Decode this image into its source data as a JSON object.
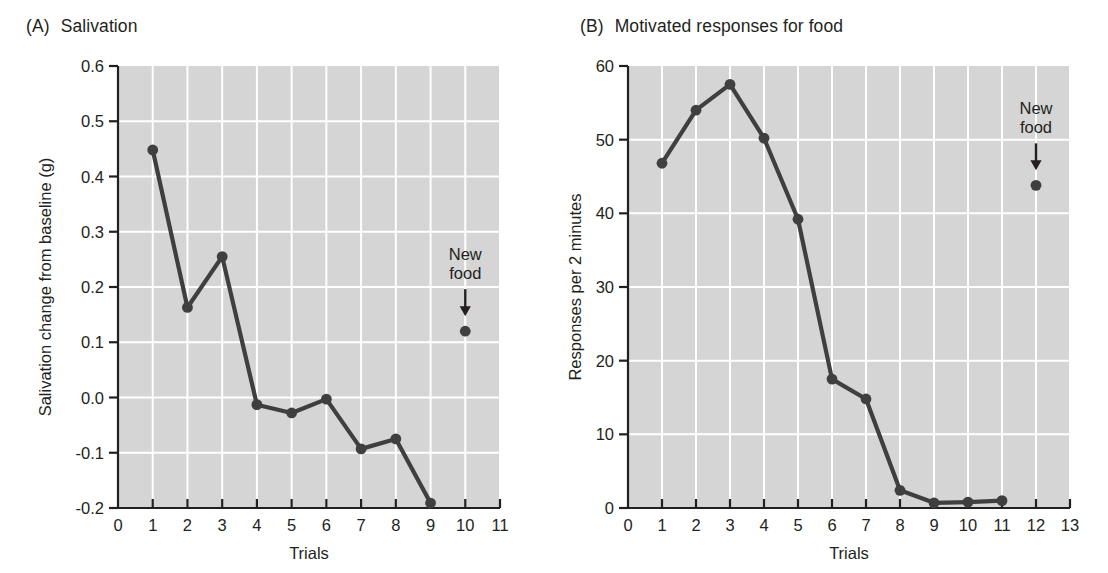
{
  "figure": {
    "background": "#ffffff",
    "plot_area_fill": "#d5d5d5",
    "grid_color": "#ffffff",
    "line_color": "#3f3f3f",
    "axis_color": "#231f20",
    "text_color": "#231f20"
  },
  "panels": [
    {
      "tag": "(A)",
      "title": "Salivation",
      "annotation_line1": "New",
      "annotation_line2": "food"
    },
    {
      "tag": "(B)",
      "title": "Motivated responses for food",
      "annotation_line1": "New",
      "annotation_line2": "food"
    }
  ],
  "chart_data": [
    {
      "type": "line",
      "title": "Salivation",
      "panel": "(A)",
      "xlabel": "Trials",
      "ylabel": "Salivation change from baseline (g)",
      "xlim": [
        0,
        11
      ],
      "ylim": [
        -0.2,
        0.6
      ],
      "xticks": [
        0,
        1,
        2,
        3,
        4,
        5,
        6,
        7,
        8,
        9,
        10,
        11
      ],
      "xticklabels": [
        "0",
        "1",
        "2",
        "3",
        "4",
        "5",
        "6",
        "7",
        "8",
        "9",
        "10",
        "11"
      ],
      "yticks": [
        -0.2,
        -0.1,
        0.0,
        0.1,
        0.2,
        0.3,
        0.4,
        0.5,
        0.6
      ],
      "yticklabels": [
        "-0.2",
        "-0.1",
        "0.0",
        "0.1",
        "0.2",
        "0.3",
        "0.4",
        "0.5",
        "0.6"
      ],
      "grid": true,
      "legend": "none",
      "series": [
        {
          "name": "Salivation change from baseline",
          "marker": "circle",
          "connected": true,
          "x": [
            1,
            2,
            3,
            4,
            5,
            6,
            7,
            8,
            9
          ],
          "values": [
            0.448,
            0.163,
            0.255,
            -0.013,
            -0.028,
            -0.003,
            -0.093,
            -0.075,
            -0.191
          ]
        },
        {
          "name": "New food",
          "marker": "circle",
          "connected": false,
          "x": [
            10
          ],
          "values": [
            0.12
          ]
        }
      ],
      "annotations": [
        {
          "text": "New food",
          "x": 10,
          "y": 0.12,
          "arrow": "down"
        }
      ]
    },
    {
      "type": "line",
      "title": "Motivated responses for food",
      "panel": "(B)",
      "xlabel": "Trials",
      "ylabel": "Responses per 2 minutes",
      "xlim": [
        0,
        13
      ],
      "ylim": [
        0,
        60
      ],
      "xticks": [
        0,
        1,
        2,
        3,
        4,
        5,
        6,
        7,
        8,
        9,
        10,
        11,
        12,
        13
      ],
      "xticklabels": [
        "0",
        "1",
        "2",
        "3",
        "4",
        "5",
        "6",
        "7",
        "8",
        "9",
        "10",
        "11",
        "12",
        "13"
      ],
      "yticks": [
        0,
        10,
        20,
        30,
        40,
        50,
        60
      ],
      "yticklabels": [
        "0",
        "10",
        "20",
        "30",
        "40",
        "50",
        "60"
      ],
      "grid": true,
      "legend": "none",
      "series": [
        {
          "name": "Responses per 2 minutes",
          "marker": "circle",
          "connected": true,
          "x": [
            1,
            2,
            3,
            4,
            5,
            6,
            7,
            8,
            9,
            10,
            11
          ],
          "values": [
            46.8,
            54.0,
            57.5,
            50.2,
            39.2,
            17.5,
            14.8,
            2.4,
            0.7,
            0.8,
            1.0
          ]
        },
        {
          "name": "New food",
          "marker": "circle",
          "connected": false,
          "x": [
            12
          ],
          "values": [
            43.8
          ]
        }
      ],
      "annotations": [
        {
          "text": "New food",
          "x": 12,
          "y": 43.8,
          "arrow": "down"
        }
      ]
    }
  ]
}
